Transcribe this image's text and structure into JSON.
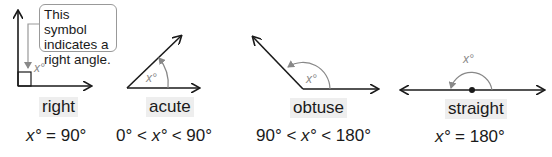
{
  "callout": {
    "lines": [
      "This symbol",
      "indicates a",
      "right angle."
    ]
  },
  "angles": [
    {
      "name": "right",
      "label": "right",
      "var": "x°",
      "formula": {
        "lhs": "x°",
        "op1": " = ",
        "rhs": "90°"
      }
    },
    {
      "name": "acute",
      "label": "acute",
      "var": "x°",
      "formula": {
        "a": "0°",
        "op1": " < ",
        "x": "x°",
        "op2": " < ",
        "b": "90°"
      }
    },
    {
      "name": "obtuse",
      "label": "obtuse",
      "var": "x°",
      "formula": {
        "a": "90°",
        "op1": " < ",
        "x": "x°",
        "op2": " < ",
        "b": "180°"
      }
    },
    {
      "name": "straight",
      "label": "straight",
      "var": "x°",
      "formula": {
        "lhs": "x°",
        "op1": " = ",
        "rhs": "180°"
      }
    }
  ],
  "colors": {
    "line": "#1a1a1a",
    "arc": "#888888",
    "label_bg": "#eeeeee"
  }
}
